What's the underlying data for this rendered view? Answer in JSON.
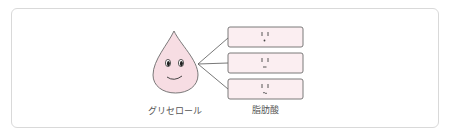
{
  "diagram": {
    "glycerol": {
      "label": "グリセロール",
      "color": "#f7dde3",
      "stroke": "#6b6b6b"
    },
    "fatty_acid": {
      "label": "脂肪酸",
      "count": 3,
      "box_fill": "#fbeef1",
      "box_stroke": "#6b6b6b",
      "faces": [
        "dot-mouth",
        "flat-mouth",
        "wavy-mouth"
      ]
    },
    "connector_color": "#555555"
  }
}
